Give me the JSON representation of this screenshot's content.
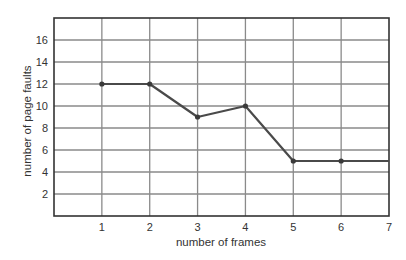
{
  "chart_data": {
    "type": "line",
    "title": "",
    "xlabel": "number of frames",
    "ylabel": "number of page faults",
    "x": [
      1,
      2,
      3,
      4,
      5,
      6,
      7
    ],
    "values": [
      12,
      12,
      9,
      10,
      5,
      5,
      5
    ],
    "series": [
      {
        "name": "page faults",
        "x": [
          1,
          2,
          3,
          4,
          5,
          6,
          7
        ],
        "values": [
          12,
          12,
          9,
          10,
          5,
          5,
          5
        ],
        "markers_at": [
          1,
          2,
          3,
          4,
          5,
          6
        ]
      }
    ],
    "xticks": [
      1,
      2,
      3,
      4,
      5,
      6,
      7
    ],
    "yticks": [
      2,
      4,
      6,
      8,
      10,
      12,
      14,
      16
    ],
    "xlim": [
      0,
      7
    ],
    "ylim": [
      0,
      18
    ],
    "grid": true,
    "legend": null,
    "colors": {
      "line": "#4a4a4a",
      "grid": "#8a8a8a",
      "axis": "#333333"
    }
  }
}
